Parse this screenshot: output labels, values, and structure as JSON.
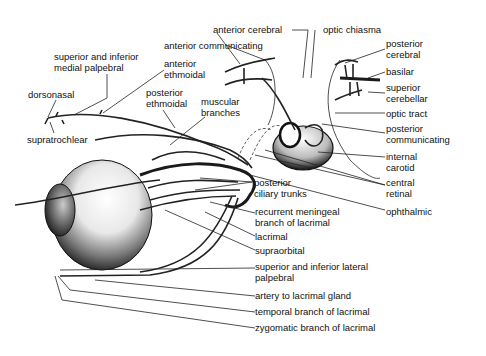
{
  "figure": {
    "labels": {
      "superior_inferior_medial_palpebral": [
        "superior and inferior",
        "medial palpebral"
      ],
      "dorsonasal": "dorsonasal",
      "supratrochlear": "supratrochlear",
      "anterior_ethmoidal": [
        "anterior",
        "ethmoidal"
      ],
      "posterior_ethmoidal": [
        "posterior",
        "ethmoidal"
      ],
      "muscular_branches": [
        "muscular",
        "branches"
      ],
      "anterior_cerebral": "anterior cerebral",
      "anterior_communicating": "anterior communicating",
      "optic_chiasma": "optic chiasma",
      "posterior_cerebral": [
        "posterior",
        "cerebral"
      ],
      "basilar": "basilar",
      "superior_cerebellar": [
        "superior",
        "cerebellar"
      ],
      "optic_tract": "optic tract",
      "posterior_communicating": [
        "posterior",
        "communicating"
      ],
      "internal_carotid": [
        "internal",
        "carotid"
      ],
      "central_retinal": [
        "central",
        "retinal"
      ],
      "ophthalmic": "ophthalmic",
      "posterior_ciliary_trunks": [
        "posterior",
        "ciliary trunks"
      ],
      "recurrent_meningeal": [
        "recurrent meningeal",
        "branch of lacrimal"
      ],
      "lacrimal": "lacrimal",
      "supraorbital": "supraorbital",
      "superior_inferior_lateral_palpebral": [
        "superior and inferior lateral",
        "palpebral"
      ],
      "artery_to_lacrimal_gland": "artery to lacrimal gland",
      "temporal_branch_lacrimal": "temporal branch of lacrimal",
      "zygomatic_branch_lacrimal": "zygomatic branch of lacrimal"
    }
  }
}
